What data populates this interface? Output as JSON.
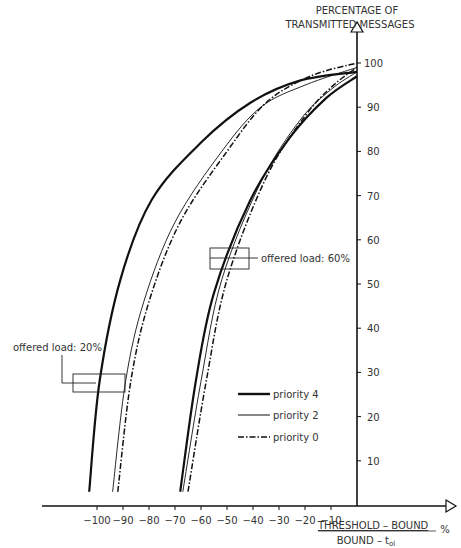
{
  "chart_data": {
    "type": "line",
    "title": "",
    "ylabel_line1": "PERCENTAGE OF",
    "ylabel_line2": "TRANSMITTED MESSAGES",
    "xlabel_numerator": "THRESHOLD – BOUND",
    "xlabel_denominator": "BOUND – t",
    "xlabel_denominator_sub": "ol",
    "xlabel_unit": "%",
    "xlim": [
      -115,
      0
    ],
    "ylim": [
      0,
      100
    ],
    "x_ticks": [
      -100,
      -90,
      -80,
      -70,
      -60,
      -50,
      -40,
      -30,
      -20,
      -10
    ],
    "y_ticks": [
      10,
      20,
      30,
      40,
      50,
      60,
      70,
      80,
      90,
      100
    ],
    "grid": false,
    "legend": [
      {
        "label": "priority 4",
        "style": "thick-solid"
      },
      {
        "label": "priority 2",
        "style": "thin-solid"
      },
      {
        "label": "priority 0",
        "style": "dash-dot"
      }
    ],
    "annotations": [
      {
        "text": "offered load: 20%"
      },
      {
        "text": "offered load: 60%"
      }
    ],
    "series": [
      {
        "name": "priority 4",
        "load": "20%",
        "x": [
          -103,
          -99,
          -91,
          -79,
          -60,
          -41,
          -22,
          0
        ],
        "y": [
          3,
          28,
          51,
          69,
          82,
          91,
          96,
          98
        ]
      },
      {
        "name": "priority 2",
        "load": "20%",
        "x": [
          -94,
          -89,
          -82,
          -70,
          -52,
          -37,
          -20,
          0
        ],
        "y": [
          3,
          28,
          46,
          64,
          80,
          90,
          95,
          99
        ]
      },
      {
        "name": "priority 0",
        "load": "20%",
        "x": [
          -92,
          -87,
          -80,
          -68,
          -50,
          -35,
          -18,
          0
        ],
        "y": [
          3,
          28,
          46,
          64,
          80,
          91,
          97,
          100
        ]
      },
      {
        "name": "priority 4",
        "load": "60%",
        "x": [
          -68,
          -62,
          -55,
          -41,
          -26,
          -12,
          0
        ],
        "y": [
          3,
          28,
          48,
          69,
          83,
          92,
          97
        ]
      },
      {
        "name": "priority 2",
        "load": "60%",
        "x": [
          -67,
          -60,
          -52,
          -37,
          -22,
          -10,
          0
        ],
        "y": [
          3,
          28,
          51,
          73,
          87,
          94,
          98
        ]
      },
      {
        "name": "priority 0",
        "load": "60%",
        "x": [
          -65,
          -58,
          -50,
          -35,
          -20,
          -9,
          0
        ],
        "y": [
          3,
          28,
          51,
          74,
          88,
          95,
          99
        ]
      }
    ]
  }
}
